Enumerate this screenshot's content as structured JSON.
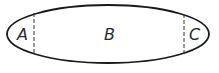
{
  "diagram": {
    "shape": "ellipse",
    "stroke_color": "#1a1a1a",
    "divider_style": "dashed",
    "regions": [
      {
        "id": "A",
        "label": "A"
      },
      {
        "id": "B",
        "label": "B"
      },
      {
        "id": "C",
        "label": "C"
      }
    ]
  }
}
